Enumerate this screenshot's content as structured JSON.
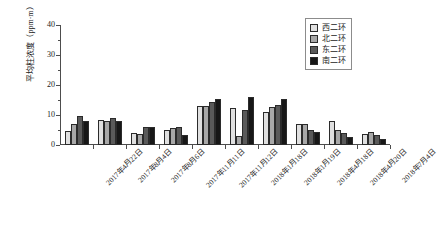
{
  "chart_data": {
    "type": "bar",
    "title": "",
    "xlabel": "",
    "ylabel": "平均柱浓度（ppm·m）",
    "ylim": [
      0,
      40
    ],
    "yticks": [
      0,
      10,
      20,
      30,
      40
    ],
    "ytick_labels": [
      "0",
      "10",
      "20",
      "30",
      "40"
    ],
    "minor_ticks": true,
    "grid": false,
    "legend_position": "top-right",
    "categories": [
      "2017年4月22日",
      "2017年8月4日",
      "2017年8月6日",
      "2017年11月11日",
      "2017年11月12日",
      "2018年1月18日",
      "2018年1月19日",
      "2018年4月18日",
      "2018年4月20日",
      "2018年7月4日"
    ],
    "series": [
      {
        "name": "西二环",
        "color": "#e0e0e0",
        "values": [
          4.6,
          8.2,
          4.1,
          5.0,
          13.0,
          12.2,
          11.0,
          7.0,
          8.0,
          3.8
        ]
      },
      {
        "name": "北二环",
        "color": "#a8a8a8",
        "values": [
          6.9,
          8.0,
          3.6,
          5.6,
          12.9,
          3.1,
          12.8,
          7.0,
          5.0,
          4.5
        ]
      },
      {
        "name": "东二环",
        "color": "#5a5a5a",
        "values": [
          9.8,
          9.0,
          6.0,
          6.1,
          14.2,
          11.8,
          13.2,
          5.0,
          4.0,
          3.4
        ]
      },
      {
        "name": "南二环",
        "color": "#171717",
        "values": [
          7.9,
          8.1,
          5.9,
          3.5,
          15.2,
          16.0,
          15.3,
          4.4,
          2.6,
          2.0
        ]
      }
    ]
  },
  "legend": {
    "items": [
      {
        "label": "西二环",
        "color": "#e0e0e0"
      },
      {
        "label": "北二环",
        "color": "#a8a8a8"
      },
      {
        "label": "东二环",
        "color": "#5a5a5a"
      },
      {
        "label": "南二环",
        "color": "#171717"
      }
    ]
  }
}
